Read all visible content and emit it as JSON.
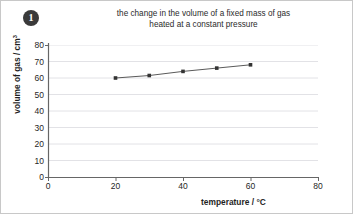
{
  "badge": {
    "number": "1"
  },
  "chart_data": {
    "type": "line",
    "title_line1": "the change in the volume of a fixed mass of gas",
    "title_line2": "heated at a constant pressure",
    "xlabel": "temperature / °C",
    "ylabel_text": "volume of gas / cm",
    "ylabel_sup": "3",
    "x": [
      20,
      30,
      40,
      50,
      60
    ],
    "values": [
      60,
      61.5,
      64,
      66,
      68
    ],
    "series": [
      {
        "name": "volume of gas",
        "values": [
          60,
          61.5,
          64,
          66,
          68
        ]
      }
    ],
    "xlim": [
      0,
      80
    ],
    "ylim": [
      0,
      80
    ],
    "xticks": [
      "0",
      "20",
      "40",
      "60",
      "80"
    ],
    "xtick_values": [
      0,
      20,
      40,
      60,
      80
    ],
    "yticks": [
      "0",
      "10",
      "20",
      "30",
      "40",
      "50",
      "60",
      "70",
      "80"
    ],
    "ytick_values": [
      0,
      10,
      20,
      30,
      40,
      50,
      60,
      70,
      80
    ],
    "grid": "horizontal",
    "legend": "none",
    "marker": "square",
    "line_color": "#5a5a5a",
    "marker_color": "#333333",
    "grid_color": "#e2e2e6",
    "axis_color": "#666666"
  }
}
